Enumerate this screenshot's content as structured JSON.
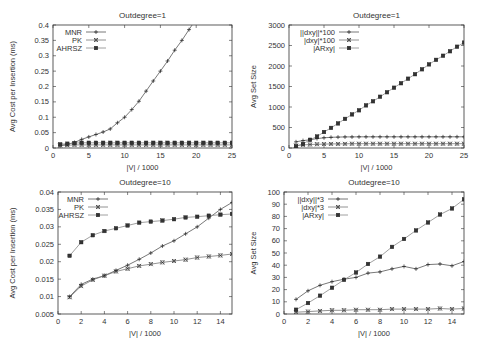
{
  "chart_data": [
    {
      "id": "tl",
      "type": "line",
      "title": "Outdegree=1",
      "xlabel": "|V| / 1000",
      "ylabel": "Avg Cost per Insertion (ms)",
      "xlim": [
        0,
        25
      ],
      "ylim": [
        0,
        0.4
      ],
      "xticks": [
        0,
        5,
        10,
        15,
        20,
        25
      ],
      "yticks": [
        0,
        0.05,
        0.1,
        0.15,
        0.2,
        0.25,
        0.3,
        0.35,
        0.4
      ],
      "ytick_labels": [
        "0",
        "0.05",
        "0.1",
        "0.15",
        "0.2",
        "0.25",
        "0.3",
        "0.35",
        "0.4"
      ],
      "legend_position": "top-left",
      "grid": false,
      "plot_box": {
        "x0": 53,
        "x1": 232,
        "y0": 148,
        "y1": 25
      },
      "series": [
        {
          "name": "MNR",
          "marker": "plus",
          "x": [
            1,
            2,
            3,
            4,
            5,
            6,
            7,
            8,
            9,
            10,
            11,
            12,
            13,
            14,
            15,
            16,
            17,
            18,
            19,
            20
          ],
          "y": [
            0.008,
            0.012,
            0.018,
            0.028,
            0.036,
            0.044,
            0.052,
            0.062,
            0.082,
            0.1,
            0.125,
            0.152,
            0.185,
            0.218,
            0.25,
            0.283,
            0.318,
            0.35,
            0.385,
            0.42
          ]
        },
        {
          "name": "PK",
          "marker": "x",
          "x": [
            1,
            2,
            3,
            4,
            5,
            6,
            7,
            8,
            9,
            10,
            11,
            12,
            13,
            14,
            15,
            16,
            17,
            18,
            19,
            20,
            21,
            22,
            23,
            24,
            25
          ],
          "y": [
            0.008,
            0.009,
            0.01,
            0.01,
            0.01,
            0.01,
            0.01,
            0.01,
            0.01,
            0.01,
            0.01,
            0.01,
            0.01,
            0.01,
            0.01,
            0.01,
            0.01,
            0.01,
            0.01,
            0.01,
            0.01,
            0.01,
            0.01,
            0.01,
            0.01
          ]
        },
        {
          "name": "AHRSZ",
          "marker": "square",
          "x": [
            1,
            2,
            3,
            4,
            5,
            6,
            7,
            8,
            9,
            10,
            11,
            12,
            13,
            14,
            15,
            16,
            17,
            18,
            19,
            20,
            21,
            22,
            23,
            24,
            25
          ],
          "y": [
            0.012,
            0.014,
            0.016,
            0.017,
            0.017,
            0.017,
            0.017,
            0.017,
            0.017,
            0.017,
            0.017,
            0.017,
            0.017,
            0.017,
            0.017,
            0.017,
            0.017,
            0.017,
            0.017,
            0.017,
            0.017,
            0.017,
            0.017,
            0.017,
            0.017
          ]
        }
      ]
    },
    {
      "id": "tr",
      "type": "line",
      "title": "Outdegree=1",
      "xlabel": "|V| / 1000",
      "ylabel": "Avg Set Size",
      "xlim": [
        0,
        25
      ],
      "ylim": [
        0,
        3000
      ],
      "xticks": [
        0,
        5,
        10,
        15,
        20,
        25
      ],
      "yticks": [
        0,
        500,
        1000,
        1500,
        2000,
        2500,
        3000
      ],
      "ytick_labels": [
        "0",
        "500",
        "1000",
        "1500",
        "2000",
        "2500",
        "3000"
      ],
      "legend_position": "top-left",
      "grid": false,
      "plot_box": {
        "x0": 289,
        "x1": 464,
        "y0": 148,
        "y1": 25
      },
      "series": [
        {
          "name": "||dxy||*100",
          "marker": "plus",
          "x": [
            1,
            2,
            3,
            4,
            5,
            6,
            7,
            8,
            9,
            10,
            11,
            12,
            13,
            14,
            15,
            16,
            17,
            18,
            19,
            20,
            21,
            22,
            23,
            24,
            25
          ],
          "y": [
            150,
            180,
            200,
            230,
            250,
            260,
            265,
            270,
            270,
            272,
            272,
            272,
            272,
            272,
            272,
            272,
            272,
            272,
            272,
            272,
            272,
            272,
            272,
            272,
            272
          ]
        },
        {
          "name": "|dxy|*100",
          "marker": "x",
          "x": [
            1,
            2,
            3,
            4,
            5,
            6,
            7,
            8,
            9,
            10,
            11,
            12,
            13,
            14,
            15,
            16,
            17,
            18,
            19,
            20,
            21,
            22,
            23,
            24,
            25
          ],
          "y": [
            60,
            75,
            85,
            90,
            95,
            100,
            100,
            102,
            105,
            105,
            105,
            105,
            105,
            105,
            105,
            105,
            105,
            105,
            105,
            105,
            105,
            105,
            105,
            105,
            105
          ]
        },
        {
          "name": "|ARxy|",
          "marker": "square",
          "x": [
            1,
            2,
            3,
            4,
            5,
            6,
            7,
            8,
            9,
            10,
            11,
            12,
            13,
            14,
            15,
            16,
            17,
            18,
            19,
            20,
            21,
            22,
            23,
            24,
            25
          ],
          "y": [
            40,
            100,
            200,
            280,
            390,
            490,
            600,
            710,
            820,
            920,
            1040,
            1140,
            1250,
            1360,
            1470,
            1580,
            1690,
            1800,
            1920,
            2040,
            2150,
            2250,
            2360,
            2470,
            2570
          ]
        }
      ]
    },
    {
      "id": "bl",
      "type": "line",
      "title": "Outdegree=10",
      "xlabel": "|V| / 1000",
      "ylabel": "Avg Cost per Insertion (ms)",
      "xlim": [
        0,
        15
      ],
      "ylim": [
        0.005,
        0.04
      ],
      "xticks": [
        0,
        2,
        4,
        6,
        8,
        10,
        12,
        14
      ],
      "yticks": [
        0.005,
        0.01,
        0.015,
        0.02,
        0.025,
        0.03,
        0.035,
        0.04
      ],
      "ytick_labels": [
        "0.005",
        "0.01",
        "0.015",
        "0.02",
        "0.025",
        "0.03",
        "0.035",
        "0.04"
      ],
      "legend_position": "top-left",
      "grid": false,
      "plot_box": {
        "x0": 58,
        "x1": 232,
        "y0": 314,
        "y1": 192
      },
      "series": [
        {
          "name": "MNR",
          "marker": "plus",
          "x": [
            1,
            2,
            3,
            4,
            5,
            6,
            7,
            8,
            9,
            10,
            11,
            12,
            13,
            14,
            15
          ],
          "y": [
            0.01,
            0.0135,
            0.015,
            0.016,
            0.0175,
            0.019,
            0.0207,
            0.0225,
            0.0245,
            0.026,
            0.028,
            0.03,
            0.0325,
            0.035,
            0.037
          ]
        },
        {
          "name": "PK",
          "marker": "x",
          "x": [
            1,
            2,
            3,
            4,
            5,
            6,
            7,
            8,
            9,
            10,
            11,
            12,
            13,
            14,
            15
          ],
          "y": [
            0.0098,
            0.013,
            0.0148,
            0.016,
            0.0172,
            0.018,
            0.0188,
            0.0193,
            0.0198,
            0.0202,
            0.0206,
            0.0212,
            0.0215,
            0.0218,
            0.0222
          ]
        },
        {
          "name": "AHRSZ",
          "marker": "square",
          "x": [
            1,
            2,
            3,
            4,
            5,
            6,
            7,
            8,
            9,
            10,
            11,
            12,
            13,
            14,
            15
          ],
          "y": [
            0.0217,
            0.0256,
            0.0276,
            0.0288,
            0.0296,
            0.0304,
            0.0312,
            0.0315,
            0.0318,
            0.0322,
            0.0327,
            0.0329,
            0.0332,
            0.0335,
            0.0337
          ]
        }
      ]
    },
    {
      "id": "br",
      "type": "line",
      "title": "Outdegree=10",
      "xlabel": "|V| / 1000",
      "ylabel": "Avg Set Size",
      "xlim": [
        0,
        15
      ],
      "ylim": [
        0,
        100
      ],
      "xticks": [
        0,
        2,
        4,
        6,
        8,
        10,
        12,
        14
      ],
      "yticks": [
        0,
        10,
        20,
        30,
        40,
        50,
        60,
        70,
        80,
        90,
        100
      ],
      "ytick_labels": [
        "0",
        "10",
        "20",
        "30",
        "40",
        "50",
        "60",
        "70",
        "80",
        "90",
        "100"
      ],
      "legend_position": "top-left",
      "grid": false,
      "plot_box": {
        "x0": 284,
        "x1": 464,
        "y0": 314,
        "y1": 192
      },
      "series": [
        {
          "name": "||dxy||*3",
          "marker": "plus",
          "x": [
            1,
            2,
            3,
            4,
            5,
            6,
            7,
            8,
            9,
            10,
            11,
            12,
            13,
            14,
            15
          ],
          "y": [
            12,
            19,
            23.5,
            26.5,
            28.5,
            30,
            33.5,
            34.5,
            37,
            39,
            37,
            40.5,
            41,
            39.5,
            43
          ]
        },
        {
          "name": "|dxy|*3",
          "marker": "x",
          "x": [
            1,
            2,
            3,
            4,
            5,
            6,
            7,
            8,
            9,
            10,
            11,
            12,
            13,
            14,
            15
          ],
          "y": [
            1.5,
            2,
            2.5,
            3,
            3,
            3.5,
            3.5,
            3.5,
            4,
            4,
            4,
            4,
            4.5,
            4,
            4.5
          ]
        },
        {
          "name": "|ARxy|",
          "marker": "square",
          "x": [
            1,
            2,
            3,
            4,
            5,
            6,
            7,
            8,
            9,
            10,
            11,
            12,
            13,
            14,
            15
          ],
          "y": [
            3.5,
            9,
            15,
            21.5,
            28,
            34,
            41,
            47,
            55,
            61.5,
            68.5,
            75,
            81.5,
            86.5,
            94
          ]
        }
      ]
    }
  ]
}
